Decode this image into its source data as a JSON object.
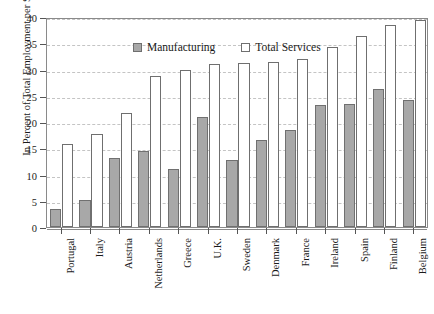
{
  "chart_data": {
    "type": "bar",
    "title": "",
    "xlabel": "",
    "ylabel": "In Percent of Total Employment per Sector",
    "ylim": [
      0,
      40
    ],
    "ytick_step": 5,
    "yticks": [
      "0",
      "5",
      "10",
      "15",
      "20",
      "25",
      "30",
      "35",
      "40"
    ],
    "grid": true,
    "legend_position": "top-left-inside",
    "categories": [
      "Portugal",
      "Italy",
      "Austria",
      "Netherlands",
      "Greece",
      "U.K.",
      "Sweden",
      "Denmark",
      "France",
      "Ireland",
      "Spain",
      "Finland",
      "Belgium"
    ],
    "series": [
      {
        "name": "Manufacturing",
        "color": "#a8a8a8",
        "values": [
          3.5,
          5.2,
          13.1,
          14.5,
          11.1,
          21.0,
          12.7,
          16.6,
          18.4,
          23.2,
          23.4,
          26.3,
          24.2
        ]
      },
      {
        "name": "Total Services",
        "color": "#ffffff",
        "values": [
          15.9,
          17.8,
          21.7,
          28.8,
          30.0,
          31.0,
          31.2,
          31.4,
          32.0,
          34.3,
          36.4,
          38.4,
          39.5
        ]
      }
    ]
  },
  "legend": {
    "items": [
      {
        "label": "Manufacturing",
        "swatch": "filled-gray-square"
      },
      {
        "label": "Total Services",
        "swatch": "open-white-square"
      }
    ]
  },
  "axes": {
    "y_title": "In Percent of Total Employment per Sector"
  }
}
